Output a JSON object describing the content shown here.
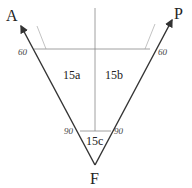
{
  "diagram": {
    "points": {
      "A": "A",
      "P": "P",
      "F": "F"
    },
    "regions": {
      "left": "15a",
      "right": "15b",
      "bottom": "15c"
    },
    "angles": {
      "top_left": "60",
      "top_right": "60",
      "bottom_left": "90",
      "bottom_right": "90"
    },
    "colors": {
      "main_line": "#333333",
      "thin_line": "#888888"
    }
  }
}
